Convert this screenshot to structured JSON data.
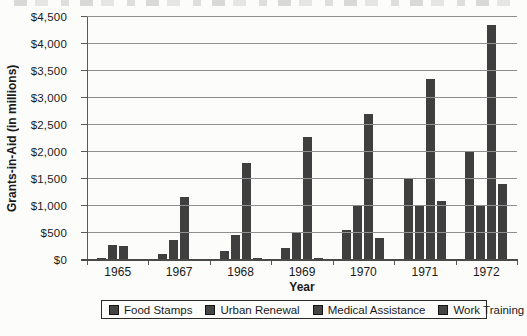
{
  "chart_data": {
    "type": "bar",
    "title": "",
    "xlabel": "Year",
    "ylabel": "Grants-in-Aid (in millions)",
    "categories": [
      "1965",
      "1967",
      "1968",
      "1969",
      "1970",
      "1971",
      "1972"
    ],
    "series": [
      {
        "name": "Food Stamps",
        "values": [
          35,
          105,
          160,
          230,
          550,
          1500,
          2000
        ]
      },
      {
        "name": "Urban Renewal",
        "values": [
          280,
          370,
          460,
          520,
          1020,
          1000,
          1000
        ]
      },
      {
        "name": "Medical Assistance",
        "values": [
          265,
          1160,
          1790,
          2270,
          2700,
          3350,
          4350
        ]
      },
      {
        "name": "Work Training",
        "values": [
          20,
          25,
          35,
          30,
          410,
          1090,
          1400
        ]
      }
    ],
    "ylim": [
      0,
      4500
    ],
    "y_tick_step": 500,
    "y_ticks": [
      "$0",
      "$500",
      "$1,000",
      "$1,500",
      "$2,000",
      "$2,500",
      "$3,000",
      "$3,500",
      "$4,000",
      "$4,500"
    ],
    "grid": true,
    "legend_position": "bottom",
    "bar_color": "#3f3f3f",
    "legend_marker_color": "#454545"
  }
}
